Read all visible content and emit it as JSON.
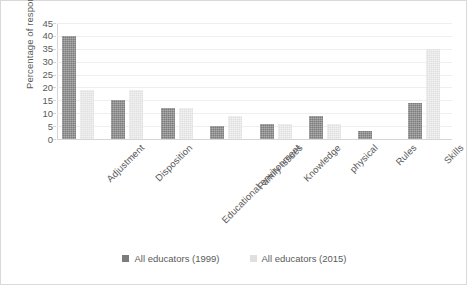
{
  "chart_data": {
    "type": "bar",
    "title": "",
    "xlabel": "",
    "ylabel": "Percentage of responses",
    "ylim": [
      0,
      45
    ],
    "ytick_step": 5,
    "yticks": [
      45,
      40,
      35,
      30,
      25,
      20,
      15,
      10,
      5,
      0
    ],
    "grid": true,
    "legend_position": "bottom",
    "categories": [
      "Adjustment",
      "Disposition",
      "Educational environment",
      "Family issues",
      "Knowledge",
      "physical",
      "Rules",
      "Skills"
    ],
    "series": [
      {
        "name": "All educators (1999)",
        "color": "#7c7c7c",
        "values": [
          40,
          15,
          12,
          5,
          6,
          9,
          3,
          14
        ]
      },
      {
        "name": "All educators (2015)",
        "color": "#e0e0e0",
        "values": [
          19,
          19,
          12,
          9,
          6,
          6,
          0,
          35
        ]
      }
    ]
  },
  "legend": {
    "items": [
      {
        "label": "All educators (1999)",
        "swatch": "legend-swatch-dark"
      },
      {
        "label": "All educators (2015)",
        "swatch": "legend-swatch-light"
      }
    ]
  }
}
